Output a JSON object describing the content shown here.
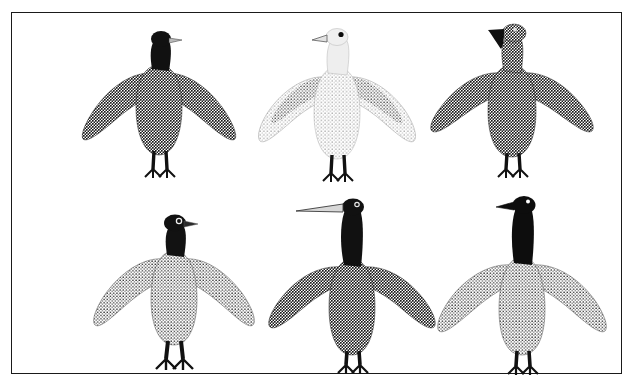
{
  "artwork": {
    "title": "Six Birds",
    "medium": "stonecut stipple print",
    "background_color": "#ffffff",
    "frame": {
      "border_color": "#1a1a1a",
      "border_width_px": 1.5,
      "x": 11,
      "y": 12,
      "width": 611,
      "height": 362
    },
    "layout": {
      "rows": 2,
      "columns": 3,
      "total_birds": 6
    },
    "palette": {
      "ink_black": "#111111",
      "dark_stipple": "#2b2b2b",
      "mid_stipple": "#5a5a5a",
      "light_stipple": "#c9c9c9",
      "pale_beak": "#bdbdbd",
      "paper": "#ffffff"
    },
    "birds": [
      {
        "id": "bird-1",
        "position": "top-left",
        "name": "black-headed-dark-bird",
        "head_fill": "ink_black",
        "body_fill": "dark_stipple",
        "wing_fill": "dark_stipple",
        "beak": "short pale beak facing right",
        "beak_direction": "right",
        "eye": "none-visible",
        "legs": "black webbed feet",
        "neck_length": "short"
      },
      {
        "id": "bird-2",
        "position": "top-center",
        "name": "pale-gull",
        "head_fill": "paper",
        "body_fill": "light_stipple",
        "wing_fill": "light_stipple with mid_stipple leading edge",
        "beak": "open pale beak facing left",
        "beak_direction": "left",
        "eye": "solid black round eye",
        "legs": "black webbed feet",
        "neck_length": "short"
      },
      {
        "id": "bird-3",
        "position": "top-right",
        "name": "hook-beak-dark-bird",
        "head_fill": "dark_stipple",
        "body_fill": "dark_stipple",
        "wing_fill": "dark_stipple",
        "beak": "downward hooked dark beak facing left",
        "beak_direction": "left",
        "eye": "small light eye",
        "legs": "black webbed feet",
        "neck_length": "long"
      },
      {
        "id": "bird-4",
        "position": "bottom-left",
        "name": "black-head-grey-bird",
        "head_fill": "ink_black",
        "body_fill": "mid_stipple",
        "wing_fill": "mid_stipple",
        "beak": "short dark beak facing right",
        "beak_direction": "right",
        "eye": "white ring eye",
        "legs": "large black webbed feet",
        "neck_length": "short"
      },
      {
        "id": "bird-5",
        "position": "bottom-center",
        "name": "long-beak-loon",
        "head_fill": "ink_black",
        "body_fill": "dark_stipple",
        "wing_fill": "dark_stipple",
        "beak": "long slender tapered beak facing left",
        "beak_direction": "left",
        "eye": "small light eye",
        "legs": "black webbed feet",
        "neck_length": "very long"
      },
      {
        "id": "bird-6",
        "position": "bottom-right",
        "name": "black-necked-goose",
        "head_fill": "ink_black",
        "body_fill": "mid_stipple",
        "wing_fill": "mid_stipple",
        "beak": "short pointed black beak facing left",
        "beak_direction": "left",
        "eye": "small white eye",
        "legs": "black webbed feet",
        "neck_length": "very long black neck"
      }
    ]
  }
}
